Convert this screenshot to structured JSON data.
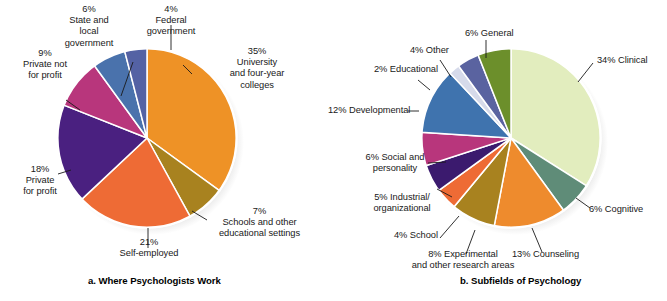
{
  "figure": {
    "background": "#ffffff",
    "text_color": "#191919"
  },
  "chart_data": [
    {
      "type": "pie",
      "id": "where-psychologists-work",
      "title": "a. Where Psychologists Work",
      "caption": "a. Where Psychologists Work",
      "start_angle_deg": 0,
      "direction": "clockwise",
      "center": [
        147,
        138
      ],
      "radius": 90,
      "unit": "%",
      "legend_position": "callout-labels",
      "grid": false,
      "categories": [
        "University and four-year colleges",
        "Schools and other educational settings",
        "Self-employed",
        "Private for profit",
        "Private not for profit",
        "State and local government",
        "Federal government"
      ],
      "values": [
        35,
        7,
        21,
        18,
        9,
        6,
        4
      ],
      "colors": [
        "#EE9226",
        "#A8821F",
        "#EE6B35",
        "#4A2080",
        "#B8367C",
        "#4A72AC",
        "#5462A4"
      ],
      "labels": [
        {
          "pct": "35%",
          "lines": [
            "35%",
            "University",
            "and four-year",
            "colleges"
          ]
        },
        {
          "pct": "7%",
          "lines": [
            "7%",
            "Schools and other",
            "educational settings"
          ]
        },
        {
          "pct": "21%",
          "lines": [
            "21%",
            "Self-employed"
          ]
        },
        {
          "pct": "18%",
          "lines": [
            "18%",
            "Private",
            "for profit"
          ]
        },
        {
          "pct": "9%",
          "lines": [
            "9%",
            "Private not",
            "for profit"
          ]
        },
        {
          "pct": "6%",
          "lines": [
            "6%",
            "State and",
            "local",
            "government"
          ]
        },
        {
          "pct": "4%",
          "lines": [
            "4%",
            "Federal",
            "government"
          ]
        }
      ],
      "label_text": {
        "university": "35%\nUniversity\nand four-year\ncolleges",
        "schools": "7%\nSchools and other\neducational settings",
        "self_employed": "21%\nSelf-employed",
        "private_for_profit": "18%\nPrivate\nfor profit",
        "private_not_for_profit": "9%\nPrivate not\nfor profit",
        "state_local": "6%\nState and\nlocal\ngovernment",
        "federal": "4%\nFederal\ngovernment"
      }
    },
    {
      "type": "pie",
      "id": "subfields-of-psychology",
      "title": "b. Subfields of Psychology",
      "caption": "b. Subfields of Psychology",
      "start_angle_deg": 0,
      "direction": "clockwise",
      "center": [
        511,
        138
      ],
      "radius": 90,
      "unit": "%",
      "legend_position": "callout-labels",
      "grid": false,
      "categories": [
        "Clinical",
        "Cognitive",
        "Counseling",
        "Experimental and other research areas",
        "School",
        "Industrial/organizational",
        "Social and personality",
        "Developmental",
        "Educational",
        "Other",
        "General"
      ],
      "values": [
        34,
        6,
        13,
        8,
        4,
        5,
        6,
        12,
        2,
        4,
        6
      ],
      "colors": [
        "#E2EDBE",
        "#5F8C78",
        "#EE8B2D",
        "#A8821F",
        "#EE6B35",
        "#3B1A6E",
        "#B8367C",
        "#3F73AE",
        "#D6DAEA",
        "#5A63A0",
        "#6C8F2B"
      ],
      "labels": [
        {
          "pct": "34%",
          "lines": [
            "34% Clinical"
          ]
        },
        {
          "pct": "6%",
          "lines": [
            "6% Cognitive"
          ]
        },
        {
          "pct": "13%",
          "lines": [
            "13% Counseling"
          ]
        },
        {
          "pct": "8%",
          "lines": [
            "8% Experimental",
            "and other research areas"
          ]
        },
        {
          "pct": "4%",
          "lines": [
            "4% School"
          ]
        },
        {
          "pct": "5%",
          "lines": [
            "5% Industrial/",
            "organizational"
          ]
        },
        {
          "pct": "6%",
          "lines": [
            "6% Social and",
            "personality"
          ]
        },
        {
          "pct": "12%",
          "lines": [
            "12% Developmental"
          ]
        },
        {
          "pct": "2%",
          "lines": [
            "2% Educational"
          ]
        },
        {
          "pct": "4%",
          "lines": [
            "4% Other"
          ]
        },
        {
          "pct": "6%",
          "lines": [
            "6% General"
          ]
        }
      ],
      "label_text": {
        "clinical": "34% Clinical",
        "cognitive": "6% Cognitive",
        "counseling": "13% Counseling",
        "experimental": "8% Experimental\nand other research areas",
        "school": "4% School",
        "industrial": "5% Industrial/\norganizational",
        "social": "6% Social and\npersonality",
        "developmental": "12% Developmental",
        "educational": "2% Educational",
        "other": "4% Other",
        "general": "6% General"
      }
    }
  ]
}
